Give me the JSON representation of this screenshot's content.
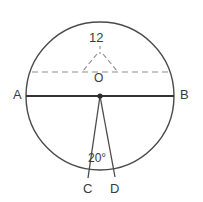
{
  "figure": {
    "stroke_color": "#4a4a4a",
    "dash_color": "#8c8c8c",
    "text_color": "#3a3a3a",
    "background": "#ffffff",
    "circle": {
      "cx": 100,
      "cy": 96,
      "r": 74
    },
    "labels": {
      "a": "A",
      "b": "B",
      "o": "O",
      "c": "C",
      "d": "D",
      "radius_measure": "12",
      "angle_measure": "20°"
    },
    "diameter": {
      "x1": 26,
      "y1": 96,
      "x2": 174,
      "y2": 96
    },
    "dashed_chord": {
      "x1": 32,
      "y1": 72,
      "x2": 168,
      "y2": 72
    },
    "pointer_left": {
      "x1": 97,
      "y1": 54,
      "x2": 82,
      "y2": 72
    },
    "pointer_right": {
      "x1": 103,
      "y1": 54,
      "x2": 118,
      "y2": 72
    },
    "pointer_stem": {
      "x1": 100,
      "y1": 46,
      "x2": 100,
      "y2": 54
    },
    "radius_oc": {
      "x1": 100,
      "y1": 96,
      "x2": 88,
      "y2": 178
    },
    "radius_od": {
      "x1": 100,
      "y1": 96,
      "x2": 115,
      "y2": 177
    },
    "center_dot": {
      "cx": 100,
      "cy": 96,
      "r": 2.6
    }
  }
}
